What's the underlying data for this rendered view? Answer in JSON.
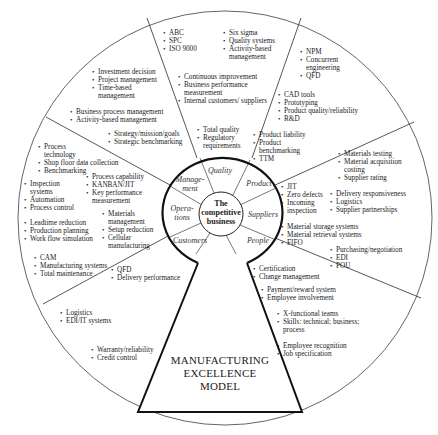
{
  "title": "MANUFACTURING EXCELLENCE MODEL",
  "model_lines": [
    "MANUFACTURING",
    "EXCELLENCE",
    "MODEL"
  ],
  "center": {
    "lines": [
      "The",
      "competitive",
      "business"
    ]
  },
  "segments": [
    {
      "id": "quality",
      "label": "Quality"
    },
    {
      "id": "product",
      "label": "Product"
    },
    {
      "id": "suppliers",
      "label": "Suppliers"
    },
    {
      "id": "people",
      "label": "People"
    },
    {
      "id": "customers",
      "label": "Customers"
    },
    {
      "id": "operations",
      "label": "Opera-\ntions"
    },
    {
      "id": "management",
      "label": "Manage-\nment"
    }
  ],
  "blocks": {
    "quality_outer_left": [
      "ABC",
      "SPC",
      "ISO 9000"
    ],
    "quality_outer_right": [
      "Six sigma",
      "Quality systems",
      "Activity-based management"
    ],
    "quality_mid": [
      "Continuous improvement",
      "Business performance measurement",
      "Internal customers/ suppliers"
    ],
    "quality_inner": [
      "Total quality",
      "Regulatory requirements"
    ],
    "product_outer": [
      "NPM",
      "Concurrent engineering",
      "QFD"
    ],
    "product_mid": [
      "CAD tools",
      "Prototyping",
      "Product quality/reliability",
      "R&D"
    ],
    "product_inner": [
      "Product liability",
      "Product benchmarking",
      "TTM"
    ],
    "suppliers_outer": [
      "Materials testing",
      "Material acquisition costing",
      "Supplier rating"
    ],
    "suppliers_mid": [
      "Delivery responsiveness",
      "Logistics",
      "Supplier partnerships"
    ],
    "suppliers_inner": [
      "JIT",
      "Zero defects",
      "Incoming inspection"
    ],
    "suppliers_inner2": [
      "Material storage systems",
      "Material retrieval systems",
      "FIFO"
    ],
    "suppliers_outer2": [
      "Purchasing/negotiation",
      "EDI",
      "POU"
    ],
    "people_inner": [
      "Certification",
      "Change management"
    ],
    "people_mid": [
      "Payment/reward system",
      "Employee involvement"
    ],
    "people_mid2": [
      "X-functional teams",
      "Skills: technical; business; process"
    ],
    "people_outer": [
      "Employee recognition",
      "Job specification"
    ],
    "management_outer": [
      "Investment decision",
      "Project management",
      "Time-based management"
    ],
    "management_mid": [
      "Business process management",
      "Activity-based management"
    ],
    "management_inner": [
      "Strategy/mission/goals",
      "Strategic benchmarking"
    ],
    "operations_outer": [
      "Process technology",
      "Shop floor data collection",
      "Benchmarking"
    ],
    "operations_outer2": [
      "Inspection systems",
      "Automation",
      "Process control"
    ],
    "operations_mid": [
      "Process capability",
      "KANBAN/JIT",
      "Key performance measurement"
    ],
    "operations_inner": [
      "Materials management",
      "Setup reduction",
      "Cellular manufacturing"
    ],
    "operations_outer3": [
      "Leadtime reduction",
      "Production planning",
      "Work flow simulation"
    ],
    "operations_outer4": [
      "CAM",
      "Manufacturing systems",
      "Total maintenance"
    ],
    "customers_inner": [
      "QFD",
      "Delivery performance"
    ],
    "customers_mid": [
      "Logistics",
      "EDI/IT systems"
    ],
    "customers_outer": [
      "Warranty/reliability",
      "Credit control"
    ]
  }
}
